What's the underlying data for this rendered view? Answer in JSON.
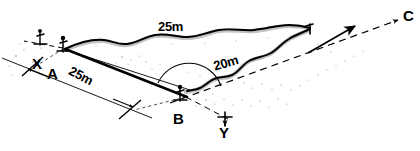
{
  "diagram": {
    "type": "surveying-sketch",
    "stroke_color": "#000000",
    "background_color": "#ffffff",
    "shadow_color": "#b3b3b3"
  },
  "points": {
    "a": {
      "label": "A",
      "role": "survey-station-near-bank"
    },
    "b": {
      "label": "B",
      "role": "survey-station-near-bank"
    },
    "c": {
      "label": "C",
      "role": "target-point-far-bank"
    },
    "x": {
      "label": "X",
      "role": "direction-marker"
    },
    "y": {
      "label": "Y",
      "role": "direction-marker"
    }
  },
  "dimensions": [
    {
      "id": "ac_reach",
      "label": "25m",
      "note": "distance along upper river reach"
    },
    {
      "id": "ab_baseline",
      "label": "25m",
      "note": "baseline from A to B"
    },
    {
      "id": "bc_reach",
      "label": "20m",
      "note": "distance along lower river reach"
    }
  ],
  "measure_unit": "m"
}
